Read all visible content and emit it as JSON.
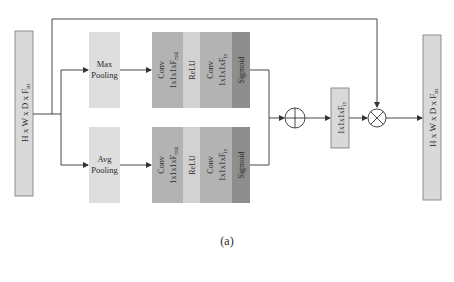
{
  "diagram": {
    "caption": "(a)",
    "input": {
      "label": "H x W x D x F",
      "sub": "in"
    },
    "output": {
      "label": "H x W x D x F",
      "sub": "in"
    },
    "branches": [
      {
        "pool_line1": "Max",
        "pool_line2": "Pooling",
        "conv1_line1": "Conv",
        "conv1_line2": "1x1x1xF",
        "conv1_sub": "mid",
        "relu": "ReLU",
        "conv2_line1": "Conv",
        "conv2_line2": "1x1x1xF",
        "conv2_sub": "in",
        "sigmoid": "Sigmoid"
      },
      {
        "pool_line1": "Avg",
        "pool_line2": "Pooling",
        "conv1_line1": "Conv",
        "conv1_line2": "1x1x1xF",
        "conv1_sub": "mid",
        "relu": "ReLU",
        "conv2_line1": "Conv",
        "conv2_line2": "1x1x1xF",
        "conv2_sub": "in",
        "sigmoid": "Sigmoid"
      }
    ],
    "sum_op": "⊕",
    "attention_map": {
      "label": "1x1x1xF",
      "sub": "in"
    },
    "mult_op": "⊗",
    "colors": {
      "feature_box": "#d9d9d9",
      "pool_box": "#dedede",
      "conv": "#b3b3b3",
      "relu": "#d2d2d2",
      "sigmoid": "#8e8e8e",
      "line": "#333333"
    }
  }
}
